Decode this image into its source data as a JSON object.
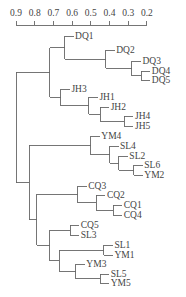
{
  "chart_data": {
    "type": "dendrogram",
    "title": "",
    "axis": {
      "position": "top",
      "ticks": [
        0.9,
        0.8,
        0.7,
        0.6,
        0.5,
        0.4,
        0.3,
        0.2
      ],
      "tick_labels": [
        "0.9",
        "0.8",
        "0.7",
        "0.6",
        "0.5",
        "0.4",
        "0.3",
        "0.2"
      ],
      "range": [
        0.9,
        0.2
      ],
      "xlabel": ""
    },
    "leaves": [
      "DQ1",
      "DQ2",
      "DQ3",
      "DQ4",
      "DQ5",
      "JH3",
      "JH1",
      "JH2",
      "JH4",
      "JH5",
      "YM4",
      "SL4",
      "SL2",
      "SL6",
      "YM2",
      "CQ3",
      "CQ2",
      "CQ1",
      "CQ4",
      "CQ5",
      "SL3",
      "SL1",
      "YM1",
      "YM3",
      "SL5",
      "YM5"
    ],
    "leaf_y": [
      36,
      50,
      61,
      71,
      80,
      89,
      97,
      107,
      116,
      126,
      136,
      146,
      156,
      165,
      175,
      186,
      195,
      205,
      215,
      225,
      235,
      245,
      255,
      264,
      274,
      283
    ],
    "merges": [
      {
        "id": "n1",
        "children": [
          "DQ4",
          "DQ5"
        ],
        "height": 0.23
      },
      {
        "id": "n2",
        "children": [
          "DQ3",
          "n1"
        ],
        "height": 0.28
      },
      {
        "id": "n3",
        "children": [
          "DQ2",
          "n2"
        ],
        "height": 0.42
      },
      {
        "id": "n4",
        "children": [
          "DQ1",
          "n3"
        ],
        "height": 0.64
      },
      {
        "id": "n5",
        "children": [
          "JH4",
          "JH5"
        ],
        "height": 0.32
      },
      {
        "id": "n6",
        "children": [
          "JH2",
          "n5"
        ],
        "height": 0.45
      },
      {
        "id": "n7",
        "children": [
          "JH1",
          "n6"
        ],
        "height": 0.51
      },
      {
        "id": "n8",
        "children": [
          "JH3",
          "n7"
        ],
        "height": 0.66
      },
      {
        "id": "n9",
        "children": [
          "n4",
          "n8"
        ],
        "height": 0.72
      },
      {
        "id": "n10",
        "children": [
          "SL6",
          "YM2"
        ],
        "height": 0.27
      },
      {
        "id": "n11",
        "children": [
          "SL2",
          "n10"
        ],
        "height": 0.35
      },
      {
        "id": "n12",
        "children": [
          "SL4",
          "n11"
        ],
        "height": 0.4
      },
      {
        "id": "n13",
        "children": [
          "YM4",
          "n12"
        ],
        "height": 0.5
      },
      {
        "id": "n14",
        "children": [
          "CQ1",
          "CQ4"
        ],
        "height": 0.38
      },
      {
        "id": "n15",
        "children": [
          "CQ2",
          "n14"
        ],
        "height": 0.47
      },
      {
        "id": "n16",
        "children": [
          "CQ3",
          "n15"
        ],
        "height": 0.57
      },
      {
        "id": "n17",
        "children": [
          "CQ5",
          "SL3"
        ],
        "height": 0.61
      },
      {
        "id": "n18",
        "children": [
          "SL1",
          "YM1"
        ],
        "height": 0.43
      },
      {
        "id": "n19",
        "children": [
          "SL5",
          "YM5"
        ],
        "height": 0.45
      },
      {
        "id": "n20",
        "children": [
          "YM3",
          "n19"
        ],
        "height": 0.58
      },
      {
        "id": "n21",
        "children": [
          "n18",
          "n20"
        ],
        "height": 0.67
      },
      {
        "id": "n22",
        "children": [
          "n17",
          "n21"
        ],
        "height": 0.72
      },
      {
        "id": "n23",
        "children": [
          "n16",
          "n22"
        ],
        "height": 0.79
      },
      {
        "id": "n24",
        "children": [
          "n13",
          "n23"
        ],
        "height": 0.83
      },
      {
        "id": "root",
        "children": [
          "n9",
          "n24"
        ],
        "height": 0.9
      }
    ]
  }
}
